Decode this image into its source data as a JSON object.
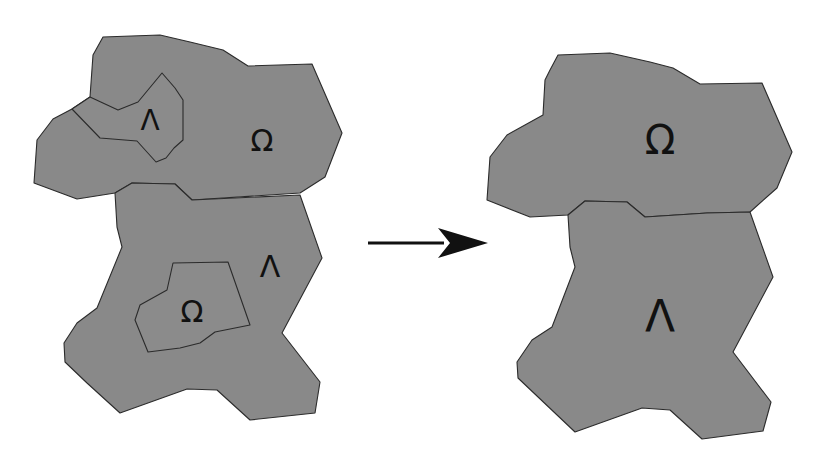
{
  "diagram": {
    "colors": {
      "region_fill": "#898989",
      "outline": "#2b2b2b",
      "glyph": "#111111",
      "background": "#ffffff"
    },
    "before": {
      "regions": [
        {
          "name": "before-top-region",
          "points": "103,37 160,35 190,42 223,50 248,66 312,64 342,133 325,177 300,193 192,200 175,184 132,183 115,193 77,199 34,183 37,140 53,119 72,109 90,97 93,55",
          "label": "Ω",
          "label_x": 262,
          "label_y": 140,
          "label_size": 30
        },
        {
          "name": "before-bottom-region",
          "points": "115,193 132,183 175,184 192,200 300,195 322,258 282,333 320,382 315,413 250,420 217,390 187,389 120,413 87,383 65,362 64,343 77,323 97,308 122,247 117,227",
          "label": "Λ",
          "label_x": 270,
          "label_y": 266,
          "label_size": 30
        }
      ],
      "subregions": [
        {
          "name": "before-top-inner-region",
          "points": "72,109 90,97 118,110 138,102 162,73 175,88 183,100 183,140 174,148 166,158 156,162 137,141 100,138",
          "label": "Λ",
          "label_x": 150,
          "label_y": 120,
          "label_size": 28
        },
        {
          "name": "before-bottom-inner-region",
          "points": "173,263 228,262 250,325 215,332 200,343 180,348 148,352 135,320 140,305 167,290",
          "label": "Ω",
          "label_x": 192,
          "label_y": 311,
          "label_size": 30
        }
      ]
    },
    "arrow": {
      "x1": 368,
      "y1": 243,
      "x2": 488,
      "y2": 243,
      "head_length": 50,
      "head_half_width": 15
    },
    "after": {
      "regions": [
        {
          "name": "after-top-region",
          "points": "558,55 610,53 650,62 673,68 700,84 762,83 792,152 777,188 750,212 707,213 645,217 627,202 585,201 568,215 530,217 487,200 490,157 507,135 543,115 545,80 550,70",
          "label": "Ω",
          "label_x": 660,
          "label_y": 140,
          "label_size": 40
        },
        {
          "name": "after-bottom-region",
          "points": "568,215 585,201 627,202 645,217 707,213 750,212 773,277 733,352 771,402 763,431 702,439 670,410 642,408 575,432 518,378 517,362 532,340 552,327 575,267 570,247",
          "label": "Λ",
          "label_x": 660,
          "label_y": 316,
          "label_size": 44
        }
      ]
    }
  }
}
